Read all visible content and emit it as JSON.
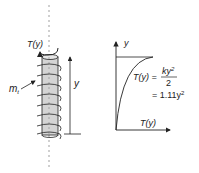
{
  "left_figure": {
    "torque_label": "T(y)",
    "distributed_torque_label": "m",
    "distributed_torque_subscript": "t",
    "height_label": "y"
  },
  "right_figure": {
    "y_axis_label": "y",
    "x_axis_label": "T(y)",
    "equation_lhs": "T(y) =",
    "equation_numerator": "ky",
    "equation_numerator_exp": "2",
    "equation_denominator": "2",
    "equation_result": "= 1.11y",
    "equation_result_exp": "2"
  },
  "colors": {
    "rod_fill": "#d4d4d4",
    "line": "#222222",
    "axis_dashed": "#888888"
  }
}
